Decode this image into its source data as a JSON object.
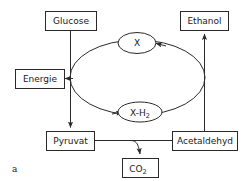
{
  "figure": {
    "panel_label": "a",
    "background_color": "#ffffff",
    "stroke_color": "#2a2a2a",
    "text_color": "#1a1a1a"
  },
  "nodes": {
    "glucose": {
      "label": "Glucose",
      "shape": "box"
    },
    "ethanol": {
      "label": "Ethanol",
      "shape": "box"
    },
    "energie": {
      "label": "Energie",
      "shape": "box"
    },
    "pyruvat": {
      "label": "Pyruvat",
      "shape": "box"
    },
    "acetaldehyd": {
      "label": "Acetaldehyd",
      "shape": "box"
    },
    "co2": {
      "label": "CO",
      "sub": "2",
      "shape": "box"
    },
    "x": {
      "label": "X",
      "shape": "ellipse"
    },
    "xh2": {
      "label": "X-H",
      "sub": "2",
      "shape": "ellipse"
    }
  },
  "edges": [
    {
      "from": "glucose",
      "to": "pyruvat",
      "arrow": "end"
    },
    {
      "from": "cycle",
      "to": "energie",
      "arrow": "end"
    },
    {
      "from": "acetaldehyd",
      "to": "ethanol",
      "arrow": "end"
    },
    {
      "from": "acetaldehyd",
      "to": "pyruvat",
      "arrow": "none"
    },
    {
      "from": "pyruvat-branch",
      "to": "co2",
      "arrow": "end"
    },
    {
      "from": "x",
      "to": "xh2",
      "arrow": "end"
    },
    {
      "from": "xh2",
      "to": "x",
      "arrow": "end"
    }
  ]
}
